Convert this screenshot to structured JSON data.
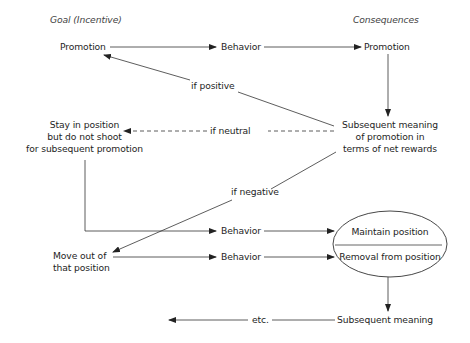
{
  "headers": {
    "goal": "Goal (Incentive)",
    "consequences": "Consequences"
  },
  "nodes": {
    "promotion_goal": "Promotion",
    "behavior_top": "Behavior",
    "promotion_consequence": "Promotion",
    "subsequent_meaning": [
      "Subsequent meaning",
      "of promotion in",
      "terms of net rewards"
    ],
    "stay_in_position": [
      "Stay in position",
      "but do not shoot",
      "for subsequent promotion"
    ],
    "behavior_mid": "Behavior",
    "move_out": [
      "Move out of",
      "that position"
    ],
    "behavior_low": "Behavior",
    "maintain_position": "Maintain position",
    "removal_from_position": "Removal from position",
    "subsequent_meaning_bottom": "Subsequent meaning",
    "etc": "etc."
  },
  "edge_labels": {
    "if_positive": "if positive",
    "if_neutral": "if neutral",
    "if_negative": "if negative"
  },
  "colors": {
    "line": "#333333",
    "text": "#1e1e1e"
  }
}
